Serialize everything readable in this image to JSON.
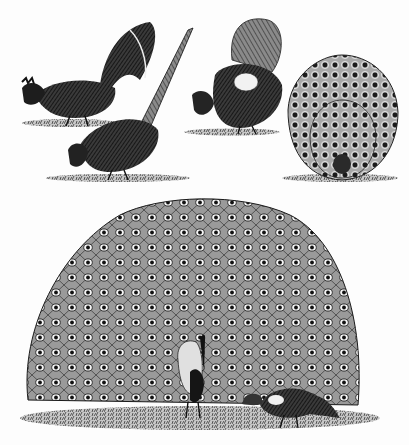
{
  "image": {
    "description": "Black-and-white engraving of gallinaceous birds: a rooster, a long-tailed pheasant, a displaying grouse-like bird, a displaying peacock-pheasant, and a large peacock with fan spread beside a peahen",
    "palette": {
      "ink": "#1a1a1a",
      "paper": "#fdfdfd",
      "mid": "#6a6a6a"
    },
    "figures": [
      {
        "id": "rooster",
        "label": "rooster pecking"
      },
      {
        "id": "pheasant",
        "label": "long-tailed pheasant"
      },
      {
        "id": "grouse",
        "label": "displaying grouse"
      },
      {
        "id": "peacock-pheasant",
        "label": "peacock-pheasant in display"
      },
      {
        "id": "peacock",
        "label": "peacock with fan spread"
      },
      {
        "id": "peahen",
        "label": "peahen feeding"
      }
    ]
  }
}
